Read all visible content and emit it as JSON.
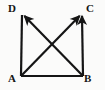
{
  "figure": {
    "background_color": "#fbfbfa",
    "stroke_color": "#151515",
    "stroke_width": 2.2,
    "view_box": "0 0 105 90",
    "vertices": [
      {
        "name": "A",
        "label": "A",
        "x": 21,
        "y": 76,
        "label_x": 8,
        "label_y": 73
      },
      {
        "name": "B",
        "label": "B",
        "x": 83,
        "y": 76,
        "label_x": 84,
        "label_y": 73
      },
      {
        "name": "C",
        "label": "C",
        "x": 82,
        "y": 13,
        "label_x": 86,
        "label_y": 3
      },
      {
        "name": "D",
        "label": "D",
        "x": 22,
        "y": 13,
        "label_x": 8,
        "label_y": 3
      }
    ],
    "segments": [
      {
        "name": "segment-AB",
        "from": "A",
        "to": "B",
        "x1": 21,
        "y1": 76,
        "x2": 83,
        "y2": 76,
        "arrow": false
      },
      {
        "name": "vector-AD",
        "from": "A",
        "to": "D",
        "x1": 21,
        "y1": 76,
        "x2": 22,
        "y2": 15,
        "arrow": false
      },
      {
        "name": "vector-BC",
        "from": "B",
        "to": "C",
        "x1": 83,
        "y1": 76,
        "x2": 82,
        "y2": 15,
        "arrow": true
      },
      {
        "name": "vector-AC",
        "from": "A",
        "to": "C",
        "x1": 22,
        "y1": 75,
        "x2": 80,
        "y2": 15,
        "arrow": true
      },
      {
        "name": "vector-BD",
        "from": "B",
        "to": "D",
        "x1": 82,
        "y1": 75,
        "x2": 24,
        "y2": 15,
        "arrow": true
      }
    ],
    "intersection": {
      "name": "diagonal-crossing",
      "x": 52,
      "y": 45
    }
  }
}
